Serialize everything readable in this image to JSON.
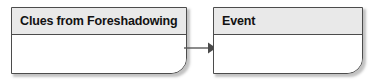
{
  "diagram": {
    "type": "flow",
    "background_color": "#ffffff",
    "nodes": [
      {
        "id": "clues",
        "title": "Clues from Foreshadowing",
        "header_fill": "#e9e9e9",
        "body_fill": "#ffffff",
        "border_color": "#4c4c4c"
      },
      {
        "id": "event",
        "title": "Event",
        "header_fill": "#e9e9e9",
        "body_fill": "#ffffff",
        "border_color": "#4c4c4c"
      }
    ],
    "connectors": [
      {
        "id": "clues-to-event",
        "from": "clues",
        "to": "event",
        "style": "solid",
        "arrowhead": "filled-triangle",
        "color": "#5a5a5a",
        "label": ""
      }
    ]
  }
}
